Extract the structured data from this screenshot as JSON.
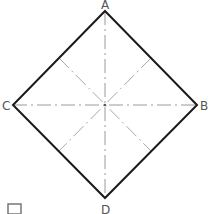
{
  "diagram": {
    "type": "geometric-construction",
    "shape": "square rotated 45 degrees (rhombus) with center lines and perpendicular bisectors",
    "vertices": [
      {
        "id": "A",
        "label": "A",
        "x": 105,
        "y": 11,
        "label_x": 101,
        "label_y": 9
      },
      {
        "id": "B",
        "label": "B",
        "x": 197,
        "y": 105,
        "label_x": 200,
        "label_y": 110
      },
      {
        "id": "C",
        "label": "C",
        "x": 13,
        "y": 105,
        "label_x": 2,
        "label_y": 110
      },
      {
        "id": "D",
        "label": "D",
        "x": 105,
        "y": 198,
        "label_x": 101,
        "label_y": 214
      }
    ],
    "center": {
      "x": 105,
      "y": 105
    },
    "edges": [
      [
        "A",
        "B"
      ],
      [
        "B",
        "D"
      ],
      [
        "D",
        "C"
      ],
      [
        "C",
        "A"
      ]
    ],
    "center_lines": [
      {
        "from": "A",
        "to": "D",
        "style": "dash-dot"
      },
      {
        "from": "C",
        "to": "B",
        "style": "dash-dot"
      }
    ],
    "bisectors": [
      {
        "x1": 59,
        "y1": 58,
        "x2": 151,
        "y2": 151,
        "style": "dash-dot"
      },
      {
        "x1": 151,
        "y1": 58,
        "x2": 59,
        "y2": 151,
        "style": "dash-dot"
      }
    ],
    "corner_box": {
      "x": 8,
      "y": 204,
      "w": 13,
      "h": 10
    }
  },
  "colors": {
    "outline": "#1a1a1a",
    "centerline": "#9a9a9a",
    "label": "#555555",
    "background": "#ffffff"
  }
}
